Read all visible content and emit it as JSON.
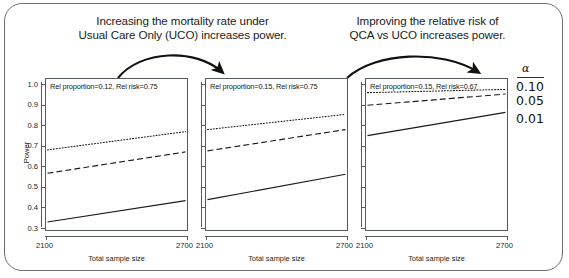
{
  "annotations": {
    "left": {
      "line1": "Increasing the mortality rate under",
      "line2": "Usual Care Only (UCO) increases power."
    },
    "right": {
      "line1": "Improving the relative risk of",
      "line2": "QCA vs UCO increases power."
    }
  },
  "legend": {
    "title": "α",
    "items": [
      "0.10",
      "0.05",
      "0.01"
    ]
  },
  "axes": {
    "ylabel": "Power",
    "xlabel": "Total sample size",
    "yticks": [
      "1.0",
      "0.9",
      "0.8",
      "0.7",
      "0.6",
      "0.5",
      "0.4",
      "0.3"
    ],
    "xticks": [
      "2100",
      "2700"
    ]
  },
  "chart_data": {
    "type": "line",
    "title": "",
    "xlabel": "Total sample size",
    "ylabel": "Power",
    "xlim": [
      2100,
      2700
    ],
    "ylim": [
      0.3,
      1.0
    ],
    "grid": false,
    "legend_position": "right",
    "legend_title": "α",
    "x": [
      2100,
      2700
    ],
    "panels": [
      {
        "label": "Rel proportion=0.12, Rel risk=0.75",
        "rel_proportion": 0.12,
        "rel_risk": 0.75,
        "series": [
          {
            "name": "0.10",
            "alpha": 0.1,
            "style": "dotted",
            "values": [
              0.68,
              0.77
            ]
          },
          {
            "name": "0.05",
            "alpha": 0.05,
            "style": "dashed",
            "values": [
              0.565,
              0.67
            ]
          },
          {
            "name": "0.01",
            "alpha": 0.01,
            "style": "solid",
            "values": [
              0.325,
              0.43
            ]
          }
        ]
      },
      {
        "label": "Rel proportion=0.15, Rel risk=0.75",
        "rel_proportion": 0.15,
        "rel_risk": 0.75,
        "series": [
          {
            "name": "0.10",
            "alpha": 0.1,
            "style": "dotted",
            "values": [
              0.78,
              0.855
            ]
          },
          {
            "name": "0.05",
            "alpha": 0.05,
            "style": "dashed",
            "values": [
              0.675,
              0.78
            ]
          },
          {
            "name": "0.01",
            "alpha": 0.01,
            "style": "solid",
            "values": [
              0.435,
              0.56
            ]
          }
        ]
      },
      {
        "label": "Rel proportion=0.15, Rel risk=0.67",
        "rel_proportion": 0.15,
        "rel_risk": 0.67,
        "series": [
          {
            "name": "0.10",
            "alpha": 0.1,
            "style": "dotted",
            "values": [
              0.962,
              0.978
            ]
          },
          {
            "name": "0.05",
            "alpha": 0.05,
            "style": "dashed",
            "values": [
              0.9,
              0.955
            ]
          },
          {
            "name": "0.01",
            "alpha": 0.01,
            "style": "solid",
            "values": [
              0.75,
              0.865
            ]
          }
        ]
      }
    ]
  },
  "colors": {
    "line": "#1a1a1a",
    "axis": "#55595d",
    "frame": "#6d6d6d",
    "text": "#1b1b1b"
  }
}
